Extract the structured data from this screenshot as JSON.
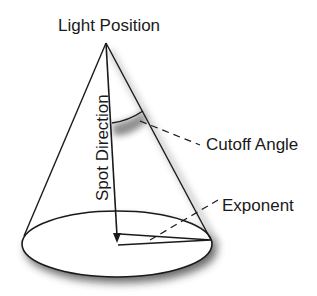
{
  "diagram": {
    "title_label": "Light Position",
    "labels": {
      "light_position": "Light Position",
      "spot_direction": "Spot Direction",
      "cutoff_angle": "Cutoff Angle",
      "exponent": "Exponent"
    },
    "colors": {
      "stroke": "#1a1a1a",
      "background": "#ffffff",
      "shadow": "#555555"
    }
  }
}
